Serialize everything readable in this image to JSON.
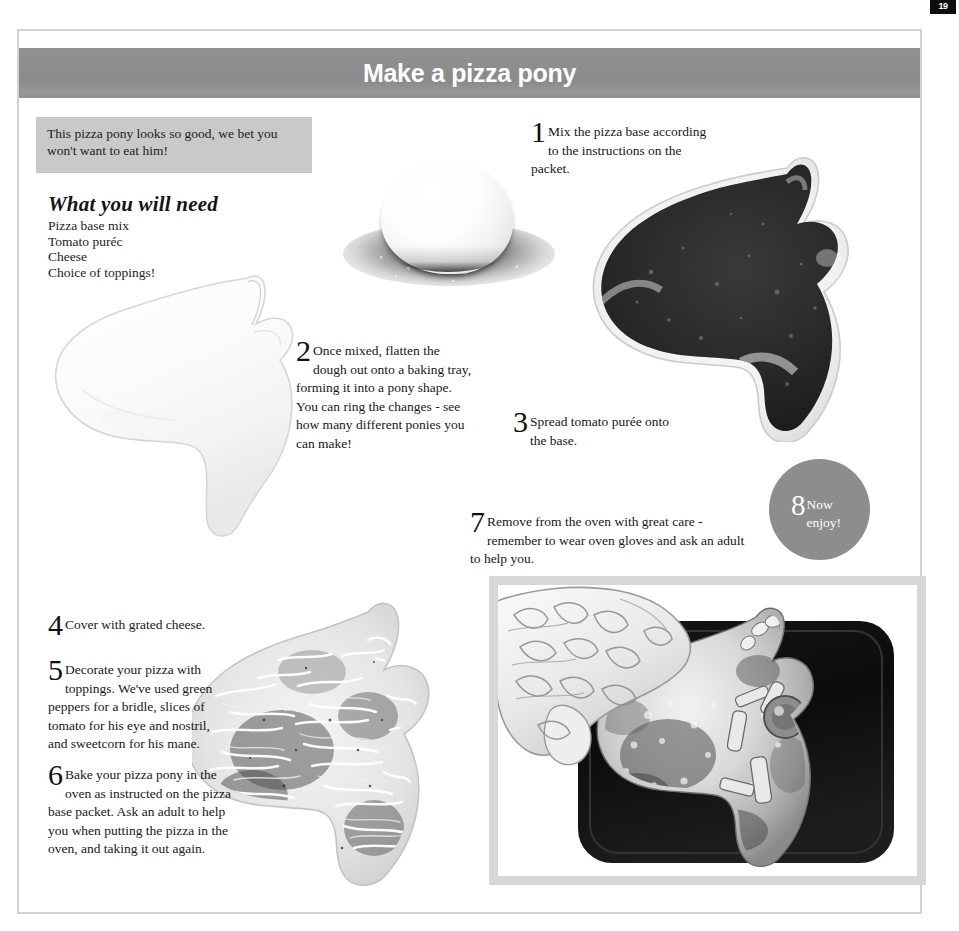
{
  "page": {
    "number": "19",
    "title": "Make a pizza pony",
    "banner_color": "#8d8d8d",
    "intro_box_color": "#c9c9c9",
    "border_color": "#d2d2d2",
    "badge_color": "#8d8d8d",
    "photo_frame_color": "#d7d7d7"
  },
  "intro": {
    "text": "This pizza pony looks so good, we bet you won't want to eat him!"
  },
  "needs": {
    "heading": "What you will need",
    "items": [
      "Pizza base mix",
      "Tomato puréc",
      "Cheese",
      "Choice of toppings!"
    ]
  },
  "steps": [
    {
      "number": "1",
      "text": "Mix the pizza base according to the instructions on the packet."
    },
    {
      "number": "2",
      "text": "Once mixed, flatten the dough out onto a baking tray, forming it into a pony shape. You can ring the changes - see how many different ponies you can make!"
    },
    {
      "number": "3",
      "text": "Spread tomato purée onto the base."
    },
    {
      "number": "4",
      "text": "Cover with grated cheese."
    },
    {
      "number": "5",
      "text": "Decorate your pizza with toppings. We've used green peppers for a bridle, slices of tomato for his eye and nostril, and sweetcorn for his mane."
    },
    {
      "number": "6",
      "text": "Bake your pizza pony in the oven as instructed on the pizza base packet. Ask an adult to help you when putting the pizza in the oven, and taking it out again."
    },
    {
      "number": "7",
      "text": "Remove from the oven with great care - remember to wear oven gloves and ask an adult to help you."
    },
    {
      "number": "8",
      "text": "Now enjoy!"
    }
  ],
  "photos": {
    "dough_ball": "dough-ball-on-floured-surface-photo",
    "plain_pony": "plain-dough-pony-shape-photo",
    "tomato_pony": "pony-base-with-tomato-puree-photo",
    "cheese_pony": "pony-pizza-with-grated-cheese-photo",
    "final": "baked-pizza-pony-in-tray-with-oven-glove-photo"
  }
}
